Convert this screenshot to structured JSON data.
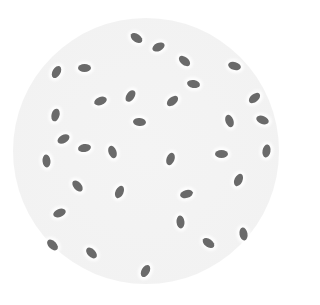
{
  "image": {
    "description": "Circular field of view (petri dish / microscope) containing scattered gray rod-shaped cells",
    "background_color": "#ffffff",
    "dish": {
      "cx": 146,
      "cy": 151,
      "r": 133,
      "color": "#f3f3f3"
    },
    "cell_color": "#6a6a6a",
    "cell_count": 33,
    "cells": [
      {
        "x": 136,
        "y": 38,
        "rot": 35
      },
      {
        "x": 158,
        "y": 47,
        "rot": -25
      },
      {
        "x": 184,
        "y": 61,
        "rot": 40
      },
      {
        "x": 234,
        "y": 66,
        "rot": 15
      },
      {
        "x": 56,
        "y": 72,
        "rot": -60
      },
      {
        "x": 84,
        "y": 68,
        "rot": 0
      },
      {
        "x": 193,
        "y": 84,
        "rot": 10
      },
      {
        "x": 130,
        "y": 96,
        "rot": -55
      },
      {
        "x": 100,
        "y": 101,
        "rot": -20
      },
      {
        "x": 172,
        "y": 101,
        "rot": -40
      },
      {
        "x": 254,
        "y": 98,
        "rot": -40
      },
      {
        "x": 55,
        "y": 115,
        "rot": -75
      },
      {
        "x": 139,
        "y": 122,
        "rot": 5
      },
      {
        "x": 229,
        "y": 121,
        "rot": 70
      },
      {
        "x": 262,
        "y": 120,
        "rot": 20
      },
      {
        "x": 63,
        "y": 139,
        "rot": -30
      },
      {
        "x": 84,
        "y": 148,
        "rot": -10
      },
      {
        "x": 112,
        "y": 152,
        "rot": 70
      },
      {
        "x": 46,
        "y": 161,
        "rot": 85
      },
      {
        "x": 170,
        "y": 159,
        "rot": -70
      },
      {
        "x": 221,
        "y": 154,
        "rot": 0
      },
      {
        "x": 266,
        "y": 151,
        "rot": -80
      },
      {
        "x": 77,
        "y": 186,
        "rot": 50
      },
      {
        "x": 119,
        "y": 192,
        "rot": -65
      },
      {
        "x": 238,
        "y": 180,
        "rot": -65
      },
      {
        "x": 186,
        "y": 194,
        "rot": -15
      },
      {
        "x": 59,
        "y": 213,
        "rot": -20
      },
      {
        "x": 180,
        "y": 222,
        "rot": 85
      },
      {
        "x": 243,
        "y": 234,
        "rot": 80
      },
      {
        "x": 52,
        "y": 245,
        "rot": 45
      },
      {
        "x": 91,
        "y": 253,
        "rot": 45
      },
      {
        "x": 208,
        "y": 243,
        "rot": 35
      },
      {
        "x": 145,
        "y": 271,
        "rot": -60
      }
    ]
  }
}
